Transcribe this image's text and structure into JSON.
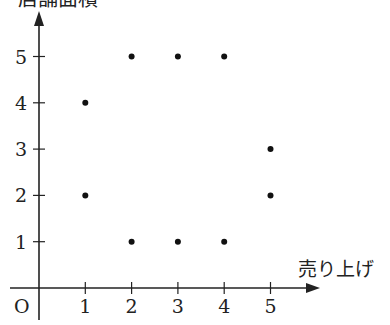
{
  "chart_data": {
    "type": "scatter",
    "title": "",
    "xlabel": "売り上げ",
    "ylabel": "店舗面積",
    "origin_label": "O",
    "x_ticks": [
      1,
      2,
      3,
      4,
      5
    ],
    "y_ticks": [
      1,
      2,
      3,
      4,
      5
    ],
    "xlim": [
      0,
      5.5
    ],
    "ylim": [
      0,
      5.5
    ],
    "grid": false,
    "legend": null,
    "points": [
      {
        "x": 1,
        "y": 4
      },
      {
        "x": 1,
        "y": 2
      },
      {
        "x": 2,
        "y": 5
      },
      {
        "x": 3,
        "y": 5
      },
      {
        "x": 4,
        "y": 5
      },
      {
        "x": 2,
        "y": 1
      },
      {
        "x": 3,
        "y": 1
      },
      {
        "x": 4,
        "y": 1
      },
      {
        "x": 5,
        "y": 3
      },
      {
        "x": 5,
        "y": 2
      }
    ],
    "color": "#111111"
  }
}
